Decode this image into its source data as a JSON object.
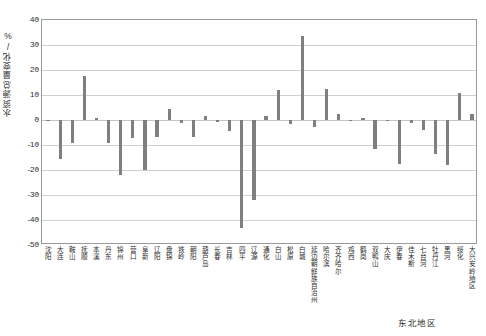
{
  "chart_data": {
    "type": "bar",
    "title": "",
    "subtitle": "",
    "xlabel": "东北地区",
    "ylabel": "水资源总量变化/%",
    "ylim": [
      -50,
      40
    ],
    "ytick_values": [
      40,
      30,
      20,
      10,
      0,
      -10,
      -20,
      -30,
      -40,
      -50
    ],
    "ytick_labels": [
      "40",
      "30",
      "20",
      "10",
      "0",
      "-10",
      "-20",
      "-30",
      "-40",
      "-50"
    ],
    "grid": "horizontal",
    "legend": "none",
    "bar_color": "#7f7f7f",
    "categories": [
      "沈阳",
      "大连",
      "鞍山",
      "抚顺",
      "本溪",
      "丹东",
      "锦州",
      "营口",
      "阜新",
      "辽阳",
      "盘锦",
      "铁岭",
      "朝阳",
      "葫芦岛",
      "长春",
      "吉林",
      "四平",
      "辽源",
      "通化",
      "白山",
      "松原",
      "白城",
      "延边朝鲜族自治州",
      "哈尔滨",
      "齐齐哈尔",
      "鸡西",
      "鹤岗",
      "双鸭山",
      "大庆",
      "伊春",
      "佳木斯",
      "七台河",
      "牡丹江",
      "黑河",
      "绥化",
      "大兴安岭地区"
    ],
    "values": [
      -0.4,
      -15.5,
      -9.0,
      17.8,
      0.8,
      -9.0,
      -22.0,
      -7.2,
      -20.0,
      -6.8,
      4.6,
      -1.2,
      -6.6,
      1.8,
      -0.9,
      -4.2,
      -43.0,
      -32.0,
      1.5,
      12.0,
      -1.5,
      33.5,
      -2.8,
      12.5,
      2.5,
      -0.5,
      1.0,
      -11.5,
      -0.3,
      -17.5,
      -1.0,
      -3.8,
      -13.5,
      -17.8,
      10.8,
      2.5
    ]
  }
}
